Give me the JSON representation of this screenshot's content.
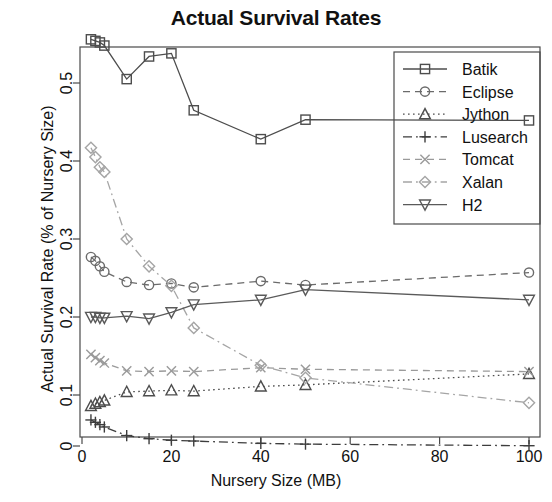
{
  "chart_data": {
    "type": "line",
    "title": "Actual Survival Rates",
    "xlabel": "Nursery Size (MB)",
    "ylabel": "Actual Survival Rate (% of Nursery Size)",
    "xlim": [
      0,
      104
    ],
    "ylim": [
      0,
      0.58
    ],
    "xticks": [
      0,
      20,
      40,
      60,
      80,
      100
    ],
    "xtick_labels": [
      "0",
      "20",
      "40",
      "60",
      "80",
      "100"
    ],
    "yticks": [
      0,
      0.1,
      0.2,
      0.3,
      0.4,
      0.5
    ],
    "ytick_labels": [
      "0",
      "0.1",
      "0.2",
      "0.3",
      "0.4",
      "0.5"
    ],
    "grid": false,
    "legend_position": "top-right",
    "x": [
      2,
      3,
      4,
      5,
      10,
      15,
      20,
      25,
      40,
      50,
      100
    ],
    "series": [
      {
        "name": "Batik",
        "marker": "square",
        "dash": "solid",
        "color": "#4d4d4d",
        "values": [
          0.556,
          0.554,
          0.552,
          0.548,
          0.505,
          0.534,
          0.538,
          0.465,
          0.428,
          0.453,
          0.452
        ]
      },
      {
        "name": "Eclipse",
        "marker": "circle",
        "dash": "dashed",
        "color": "#6b6b6b",
        "values": [
          0.277,
          0.272,
          0.265,
          0.258,
          0.245,
          0.241,
          0.243,
          0.238,
          0.246,
          0.241,
          0.257
        ]
      },
      {
        "name": "Jython",
        "marker": "triangle-up",
        "dash": "dotted",
        "color": "#4d4d4d",
        "values": [
          0.086,
          0.089,
          0.091,
          0.093,
          0.104,
          0.105,
          0.106,
          0.105,
          0.111,
          0.113,
          0.127
        ]
      },
      {
        "name": "Lusearch",
        "marker": "plus",
        "dash": "dashdot",
        "color": "#3d3d3d",
        "values": [
          0.068,
          0.065,
          0.062,
          0.059,
          0.048,
          0.044,
          0.042,
          0.041,
          0.038,
          0.037,
          0.035
        ]
      },
      {
        "name": "Tomcat",
        "marker": "cross",
        "dash": "dashed",
        "color": "#9a9a9a",
        "values": [
          0.152,
          0.148,
          0.144,
          0.141,
          0.131,
          0.13,
          0.131,
          0.13,
          0.135,
          0.133,
          0.13
        ]
      },
      {
        "name": "Xalan",
        "marker": "diamond",
        "dash": "dashdot",
        "color": "#a5a5a5",
        "values": [
          0.417,
          0.405,
          0.392,
          0.386,
          0.3,
          0.265,
          0.24,
          0.186,
          0.138,
          0.122,
          0.09
        ]
      },
      {
        "name": "H2",
        "marker": "triangle-down",
        "dash": "solid",
        "color": "#5a5a5a",
        "values": [
          0.2,
          0.2,
          0.199,
          0.199,
          0.201,
          0.198,
          0.206,
          0.216,
          0.222,
          0.235,
          0.222
        ]
      }
    ]
  },
  "legend": {
    "items": [
      {
        "label": "Batik"
      },
      {
        "label": "Eclipse"
      },
      {
        "label": "Jython"
      },
      {
        "label": "Lusearch"
      },
      {
        "label": "Tomcat"
      },
      {
        "label": "Xalan"
      },
      {
        "label": "H2"
      }
    ]
  }
}
